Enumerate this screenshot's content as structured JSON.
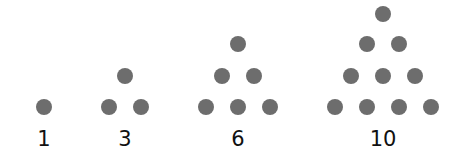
{
  "dot_color": "#6d6d6d",
  "groups": [
    {
      "label": "1",
      "label_x": 44,
      "dots": [
        [
          44,
          107
        ]
      ]
    },
    {
      "label": "3",
      "label_x": 125,
      "dots": [
        [
          125,
          76
        ],
        [
          109,
          107
        ],
        [
          141,
          107
        ]
      ]
    },
    {
      "label": "6",
      "label_x": 238,
      "dots": [
        [
          238,
          44
        ],
        [
          222,
          76
        ],
        [
          254,
          76
        ],
        [
          206,
          107
        ],
        [
          238,
          107
        ],
        [
          270,
          107
        ]
      ]
    },
    {
      "label": "10",
      "label_x": 383,
      "dots": [
        [
          383,
          14
        ],
        [
          367,
          44
        ],
        [
          399,
          44
        ],
        [
          351,
          76
        ],
        [
          383,
          76
        ],
        [
          415,
          76
        ],
        [
          335,
          107
        ],
        [
          367,
          107
        ],
        [
          399,
          107
        ],
        [
          431,
          107
        ]
      ]
    }
  ]
}
